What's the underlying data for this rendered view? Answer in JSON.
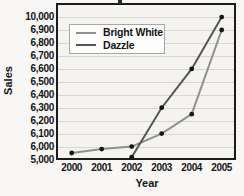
{
  "chart_data": {
    "type": "line",
    "title": "",
    "xlabel": "Year",
    "ylabel": "Sales",
    "categories": [
      "2000",
      "2001",
      "2002",
      "2003",
      "2004",
      "2005"
    ],
    "y_ticks": [
      "5,000",
      "6,000",
      "6,100",
      "6,200",
      "6,300",
      "6,400",
      "6,500",
      "6,600",
      "6,700",
      "6,800",
      "6,900",
      "10,000"
    ],
    "y_tick_values": [
      5000,
      6000,
      6100,
      6200,
      6300,
      6400,
      6500,
      6600,
      6700,
      6800,
      6900,
      10000
    ],
    "y_scale_note": "ticks equally spaced on screen despite unequal value steps (misleading axis)",
    "grid": "horizontal",
    "legend_position": "top-left",
    "series": [
      {
        "name": "Bright White",
        "color": "#8f8f8f",
        "values": [
          5500,
          5800,
          6000,
          6100,
          6250,
          6900
        ]
      },
      {
        "name": "Dazzle",
        "color": "#555555",
        "values": [
          null,
          null,
          5000,
          6300,
          6600,
          10000
        ]
      }
    ],
    "colors": {
      "marker": "#141414",
      "plot_background": "#f4f3f0",
      "page_background": "#f8f7f5",
      "gridline": "#d8d6d2",
      "frame": "#1c1c1c",
      "legend_border": "#a8a8a8"
    }
  }
}
